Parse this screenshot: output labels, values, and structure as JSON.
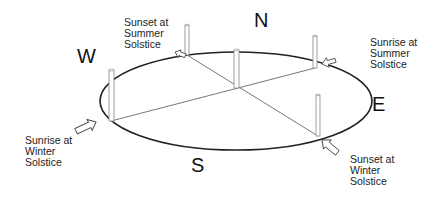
{
  "diagram": {
    "directions": {
      "north": "N",
      "south": "S",
      "east": "E",
      "west": "W"
    },
    "labels": {
      "sunset_summer": [
        "Sunset at",
        "Summer",
        "Solstice"
      ],
      "sunrise_summer": [
        "Sunrise at",
        "Summer",
        "Solstice"
      ],
      "sunrise_winter": [
        "Sunrise at",
        "Winter",
        "Solstice"
      ],
      "sunset_winter": [
        "Sunset at",
        "Winter",
        "Solstice"
      ]
    },
    "colors": {
      "line": "#222222",
      "post_fill": "#ffffff",
      "post_stroke": "#888888",
      "background": "#ffffff"
    }
  }
}
